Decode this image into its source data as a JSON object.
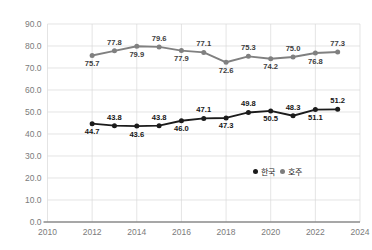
{
  "chart_data": {
    "type": "line",
    "title": "",
    "subtitle": "",
    "xlabel": "",
    "ylabel": "",
    "x": [
      2012,
      2013,
      2014,
      2015,
      2016,
      2017,
      2018,
      2019,
      2020,
      2021,
      2022,
      2023
    ],
    "xlim": [
      2010,
      2024
    ],
    "ylim": [
      0.0,
      90.0
    ],
    "xticks": [
      "2010",
      "2012",
      "2014",
      "2016",
      "2018",
      "2020",
      "2022",
      "2024"
    ],
    "xtick_values": [
      2010,
      2012,
      2014,
      2016,
      2018,
      2020,
      2022,
      2024
    ],
    "yticks": [
      "0.0",
      "10.0",
      "20.0",
      "30.0",
      "40.0",
      "50.0",
      "60.0",
      "70.0",
      "80.0",
      "90.0"
    ],
    "ytick_values": [
      0,
      10,
      20,
      30,
      40,
      50,
      60,
      70,
      80,
      90
    ],
    "grid": true,
    "legend_position": "inside-lower-right",
    "series": [
      {
        "name": "한국",
        "color": "#1b1b1b",
        "values": [
          44.7,
          43.8,
          43.6,
          43.8,
          46.0,
          47.1,
          47.3,
          49.8,
          50.5,
          48.3,
          51.1,
          51.2
        ],
        "labels": [
          "44.7",
          "43.8",
          "43.6",
          "43.8",
          "46.0",
          "47.1",
          "47.3",
          "49.8",
          "50.5",
          "48.3",
          "51.1",
          "51.2"
        ],
        "label_positions": [
          "below",
          "above",
          "below",
          "above",
          "below",
          "above",
          "below",
          "above",
          "below",
          "above",
          "below",
          "above"
        ]
      },
      {
        "name": "호주",
        "color": "#808080",
        "values": [
          75.7,
          77.8,
          79.9,
          79.6,
          77.9,
          77.1,
          72.6,
          75.3,
          74.2,
          75.0,
          76.8,
          77.3
        ],
        "labels": [
          "75.7",
          "77.8",
          "79.9",
          "79.6",
          "77.9",
          "77.1",
          "72.6",
          "75.3",
          "74.2",
          "75.0",
          "76.8",
          "77.3"
        ],
        "label_positions": [
          "below",
          "above",
          "below",
          "above",
          "below",
          "above",
          "below",
          "above",
          "below",
          "above",
          "below",
          "above"
        ]
      }
    ]
  },
  "legend": {
    "items": [
      {
        "label": "한국",
        "color": "#1b1b1b"
      },
      {
        "label": "호주",
        "color": "#7d7d7d"
      }
    ]
  },
  "colors": {
    "korea": "#1b1b1b",
    "australia": "#808080",
    "grid": "#d9d9d9",
    "axis": "#8a8a8a",
    "tick_text": "#7b7b7b"
  }
}
